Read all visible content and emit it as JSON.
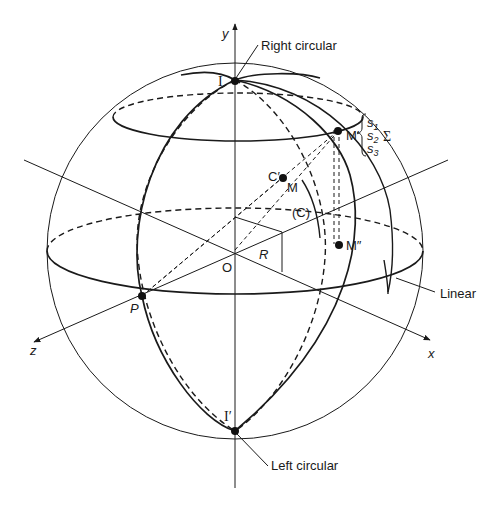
{
  "figure": {
    "axes": {
      "x_label": "x",
      "y_label": "y",
      "z_label": "z"
    },
    "points": {
      "north_pole": "I",
      "south_pole": "I′",
      "origin": "O",
      "equator_point": "P",
      "point_m_prime": "M′",
      "point_m": "M",
      "point_c_prime": "C′",
      "point_m_double_prime": "M″"
    },
    "labels": {
      "right_circular": "Right circular",
      "left_circular": "Left circular",
      "linear": "Linear",
      "radius": "R",
      "circle_c": "(C)",
      "sigma": "Σ",
      "s1_base": "s",
      "s1_sub": "1",
      "s2_base": "s",
      "s2_sub": "2",
      "s3_base": "s",
      "s3_sub": "3"
    },
    "colors": {
      "ink": "#1a1a1a",
      "background": "#ffffff"
    }
  }
}
